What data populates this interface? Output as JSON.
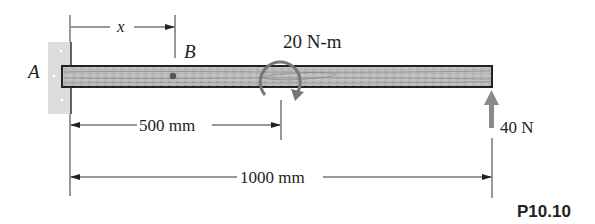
{
  "figure": {
    "id_label": "P10.10",
    "points": {
      "A": "A",
      "B": "B"
    },
    "dimensions": {
      "x": "x",
      "d500": "500 mm",
      "d1000": "1000 mm"
    },
    "loads": {
      "moment": "20 N-m",
      "force": "40 N"
    },
    "colors": {
      "beam_fill": "#b9b9b9",
      "beam_stroke": "#222222",
      "wall_fill": "#d8d8d8",
      "arrow_gray": "#8a8a8a",
      "line": "#333333"
    }
  }
}
